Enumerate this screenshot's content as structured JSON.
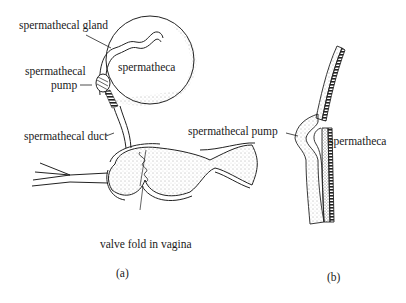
{
  "figure_a": {
    "caption": "(a)",
    "labels": {
      "spermathecal_gland": "spermathecal gland",
      "spermatheca": "spermatheca",
      "spermathecal_pump_line1": "spermathecal",
      "spermathecal_pump_line2": "pump",
      "spermathecal_duct": "spermathecal duct",
      "valve_fold": "valve fold in vagina"
    }
  },
  "figure_b": {
    "caption": "(b)",
    "labels": {
      "spermathecal_pump": "spermathecal pump",
      "spermatheca": "spermatheca"
    }
  }
}
